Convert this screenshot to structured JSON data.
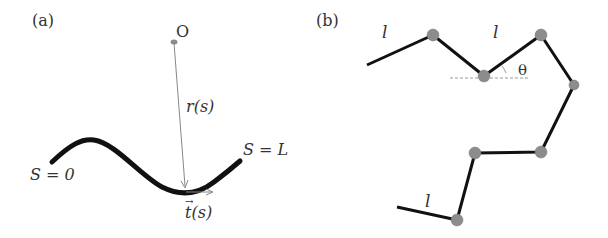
{
  "panel_a": {
    "label": "(a)",
    "origin_label": "O",
    "radius_label": "r(s)",
    "start_label": "S = 0",
    "end_label": "S = L",
    "tangent_label": "t(s)",
    "tangent_arrow": "→"
  },
  "panel_b": {
    "label": "(b)",
    "segment_label_1": "l",
    "segment_label_2": "l",
    "segment_label_3": "l",
    "angle_label": "θ"
  },
  "colors": {
    "curve": "#111111",
    "node": "#8c8c8c",
    "thin_line": "#888888"
  }
}
